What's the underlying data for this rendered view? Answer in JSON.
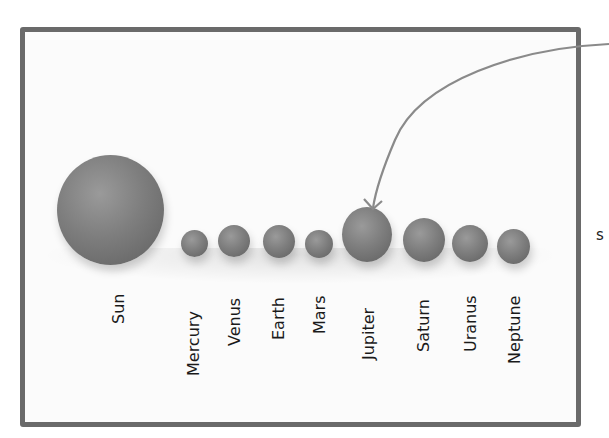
{
  "figure": {
    "title": "",
    "frame_color": "#6a6a6a",
    "ball_color": "#7e7e7e",
    "arrow_color": "#8a8a8a",
    "arrow_target": "Jupiter",
    "edge_text": "s"
  },
  "bodies": [
    {
      "name": "Sun",
      "label": "Sun",
      "x": 57,
      "y": 155,
      "w": 107,
      "h": 110,
      "label_x": 110,
      "label_len": 34
    },
    {
      "name": "Mercury",
      "label": "Mercury",
      "x": 181,
      "y": 230,
      "w": 27,
      "h": 27,
      "label_x": 185,
      "label_len": 86
    },
    {
      "name": "Venus",
      "label": "Venus",
      "x": 218,
      "y": 225,
      "w": 32,
      "h": 32,
      "label_x": 226,
      "label_len": 56
    },
    {
      "name": "Earth",
      "label": "Earth",
      "x": 263,
      "y": 225,
      "w": 32,
      "h": 33,
      "label_x": 270,
      "label_len": 50
    },
    {
      "name": "Mars",
      "label": "Mars",
      "x": 305,
      "y": 230,
      "w": 28,
      "h": 28,
      "label_x": 311,
      "label_len": 44
    },
    {
      "name": "Jupiter",
      "label": "Jupiter",
      "x": 342,
      "y": 207,
      "w": 50,
      "h": 55,
      "label_x": 360,
      "label_len": 70
    },
    {
      "name": "Saturn",
      "label": "Saturn",
      "x": 403,
      "y": 218,
      "w": 42,
      "h": 44,
      "label_x": 415,
      "label_len": 62
    },
    {
      "name": "Uranus",
      "label": "Uranus",
      "x": 452,
      "y": 225,
      "w": 36,
      "h": 37,
      "label_x": 462,
      "label_len": 62
    },
    {
      "name": "Neptune",
      "label": "Neptune",
      "x": 497,
      "y": 229,
      "w": 33,
      "h": 35,
      "label_x": 506,
      "label_len": 74
    }
  ]
}
